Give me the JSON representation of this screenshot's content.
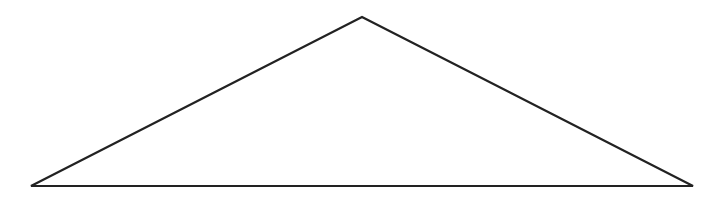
{
  "diagram": {
    "shape": "triangle",
    "stroke_color": "#222222",
    "fill_color": "#ffffff",
    "background": "#ffffff",
    "stroke_width": 2.2,
    "vertices": {
      "apex": [
        362,
        17
      ],
      "left": [
        31,
        186
      ],
      "right": [
        693,
        186
      ]
    }
  }
}
